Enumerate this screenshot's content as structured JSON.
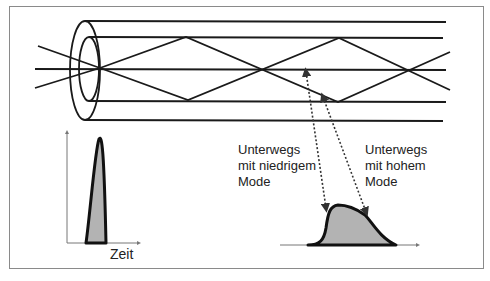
{
  "diagram": {
    "input_pulse": {
      "axis_label": "Zeit"
    },
    "labels": {
      "low_mode": [
        "Unterwegs",
        "mit niedrigem",
        "Mode"
      ],
      "high_mode": [
        "Unterwegs",
        "mit hohem",
        "Mode"
      ]
    },
    "colors": {
      "line": "#1a1a1a",
      "pulse_fill": "#b3b3b3",
      "axis": "#777777",
      "frame": "#8a8a8a"
    }
  }
}
